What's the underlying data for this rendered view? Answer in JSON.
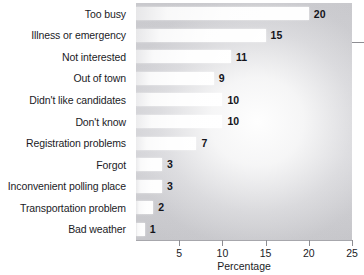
{
  "chart_data": {
    "type": "bar",
    "orientation": "horizontal",
    "title": "",
    "subtitle": "",
    "xlabel": "Percentage",
    "ylabel": "",
    "categories": [
      "Too busy",
      "Illness or emergency",
      "Not interested",
      "Out of town",
      "Didn't like candidates",
      "Don't know",
      "Registration problems",
      "Forgot",
      "Inconvenient polling place",
      "Transportation problem",
      "Bad weather"
    ],
    "values": [
      20,
      15,
      11,
      9,
      10,
      10,
      7,
      3,
      3,
      2,
      1
    ],
    "value_labels": [
      "20",
      "15",
      "11",
      "9",
      "10",
      "10",
      "7",
      "3",
      "3",
      "2",
      "1"
    ],
    "xlim": [
      0,
      25
    ],
    "xticks": [
      5,
      10,
      15,
      20,
      25
    ],
    "xtick_labels": [
      "5",
      "10",
      "15",
      "20",
      "25"
    ],
    "grid": false,
    "legend": null,
    "legend_position": "none",
    "bar_color": "#ffffff",
    "plot_background_color": "#cfcfd3",
    "page_background_color": "#ffffff",
    "text_color": "#1b1b1f"
  }
}
